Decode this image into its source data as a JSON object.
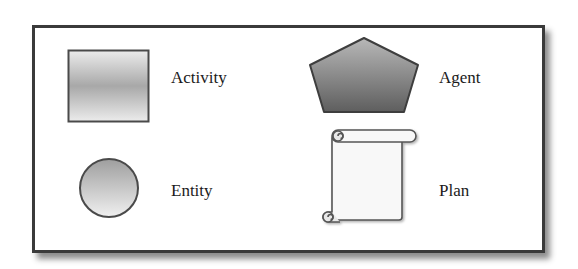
{
  "legend": {
    "items": [
      {
        "label": "Activity",
        "shape": "square",
        "icon": "activity-square-icon"
      },
      {
        "label": "Agent",
        "shape": "pentagon",
        "icon": "agent-pentagon-icon"
      },
      {
        "label": "Entity",
        "shape": "circle",
        "icon": "entity-circle-icon"
      },
      {
        "label": "Plan",
        "shape": "scroll",
        "icon": "plan-scroll-icon"
      }
    ]
  },
  "colors": {
    "border": "#3a3a3a",
    "shape_stroke": "#4a4a4a",
    "gray_light": "#e6e6e6",
    "gray_mid": "#a9a9a9",
    "gray_dark": "#6e6e6e",
    "scroll_fill": "#f7f7f7"
  }
}
